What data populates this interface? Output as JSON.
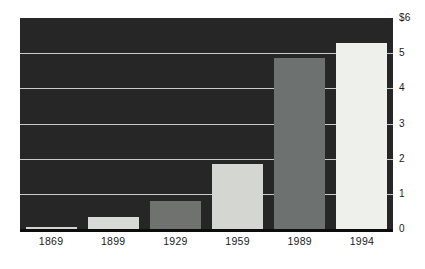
{
  "chart_data": {
    "type": "bar",
    "title": "",
    "subtitle": "",
    "xlabel": "",
    "ylabel": "",
    "categories": [
      "1869",
      "1899",
      "1929",
      "1959",
      "1989",
      "1994"
    ],
    "values": [
      0.05,
      0.35,
      0.8,
      1.85,
      4.85,
      5.3
    ],
    "series": [
      {
        "name": "",
        "values": [
          0.05,
          0.35,
          0.8,
          1.85,
          4.85,
          5.3
        ]
      }
    ],
    "bar_colors": [
      "#d2d4d0",
      "#d8dad6",
      "#70726f",
      "#d4d6d2",
      "#6d7270",
      "#eef0ec"
    ],
    "ylim": [
      0,
      6
    ],
    "ytick_values": [
      0,
      1,
      2,
      3,
      4,
      5,
      6
    ],
    "ytick_labels": [
      "0",
      "1",
      "2",
      "3",
      "4",
      "5",
      "$6"
    ],
    "xtick_labels": [
      "1869",
      "1899",
      "1929",
      "1959",
      "1989",
      "1994"
    ],
    "grid": true,
    "gridline_color": "#c9cac6",
    "plot_background": "#262626",
    "page_background": "#ffffff",
    "axis_color": "#0d0d0d",
    "text_color": "#1a1a1a",
    "legend": null,
    "legend_position": "none",
    "annotations": []
  }
}
